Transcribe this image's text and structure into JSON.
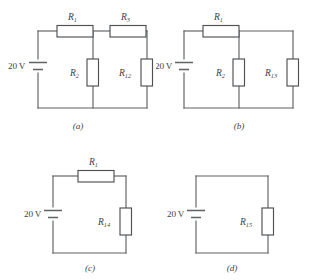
{
  "figure": {
    "background_color": "#ffffff",
    "line_color": "#5f6163",
    "text_color": "#3d3f41"
  },
  "panels": [
    {
      "id": "a",
      "caption": "(a)",
      "source": {
        "label": "20",
        "unit": "V"
      },
      "resistors": [
        {
          "name": "R1",
          "base": "R",
          "subscript": "1",
          "position": "top-left",
          "orientation": "horizontal"
        },
        {
          "name": "R3",
          "base": "R",
          "subscript": "3",
          "position": "top-right",
          "orientation": "horizontal"
        },
        {
          "name": "R2",
          "base": "R",
          "subscript": "2",
          "position": "middle-branch",
          "orientation": "vertical"
        },
        {
          "name": "R12",
          "base": "R",
          "subscript": "12",
          "position": "right-branch",
          "orientation": "vertical"
        }
      ]
    },
    {
      "id": "b",
      "caption": "(b)",
      "source": {
        "label": "20",
        "unit": "V"
      },
      "resistors": [
        {
          "name": "R1",
          "base": "R",
          "subscript": "1",
          "position": "top-left",
          "orientation": "horizontal"
        },
        {
          "name": "R2",
          "base": "R",
          "subscript": "2",
          "position": "middle-branch",
          "orientation": "vertical"
        },
        {
          "name": "R13",
          "base": "R",
          "subscript": "13",
          "position": "right-branch",
          "orientation": "vertical"
        }
      ]
    },
    {
      "id": "c",
      "caption": "(c)",
      "source": {
        "label": "20",
        "unit": "V"
      },
      "resistors": [
        {
          "name": "R1",
          "base": "R",
          "subscript": "1",
          "position": "top",
          "orientation": "horizontal"
        },
        {
          "name": "R14",
          "base": "R",
          "subscript": "14",
          "position": "right-branch",
          "orientation": "vertical"
        }
      ]
    },
    {
      "id": "d",
      "caption": "(d)",
      "source": {
        "label": "20",
        "unit": "V"
      },
      "resistors": [
        {
          "name": "R15",
          "base": "R",
          "subscript": "15",
          "position": "right-branch",
          "orientation": "vertical"
        }
      ]
    }
  ]
}
